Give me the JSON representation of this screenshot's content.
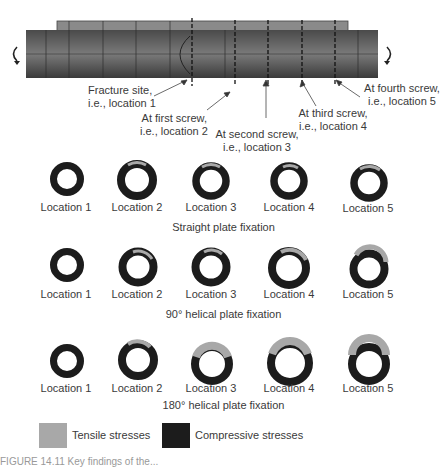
{
  "figure": {
    "bone_model": {
      "rotation_left": "counter-rotation arrow",
      "rotation_right": "rotation arrow",
      "callouts": [
        {
          "id": "loc1",
          "line1": "Fracture site,",
          "line2": "i.e., location 1"
        },
        {
          "id": "loc2",
          "line1": "At first screw,",
          "line2": "i.e., location 2"
        },
        {
          "id": "loc3",
          "line1": "At second screw,",
          "line2": "i.e., location 3"
        },
        {
          "id": "loc4",
          "line1": "At third screw,",
          "line2": "i.e., location 4"
        },
        {
          "id": "loc5",
          "line1": "At fourth screw,",
          "line2": "i.e., location 5"
        }
      ]
    },
    "rows": [
      {
        "caption": "Straight plate fixation",
        "locations": [
          "Location 1",
          "Location 2",
          "Location 3",
          "Location 4",
          "Location 5"
        ],
        "tensile_fraction": [
          0.0,
          0.04,
          0.08,
          0.06,
          0.06
        ]
      },
      {
        "caption": "90° helical plate fixation",
        "locations": [
          "Location 1",
          "Location 2",
          "Location 3",
          "Location 4",
          "Location 5"
        ],
        "tensile_fraction": [
          0.0,
          0.08,
          0.06,
          0.12,
          0.18
        ]
      },
      {
        "caption": "180° helical plate fixation",
        "locations": [
          "Location 1",
          "Location 2",
          "Location 3",
          "Location 4",
          "Location 5"
        ],
        "tensile_fraction": [
          0.0,
          0.1,
          0.3,
          0.38,
          0.35
        ]
      }
    ],
    "legend": {
      "tensile": {
        "label": "Tensile stresses",
        "color": "#a8a8a8"
      },
      "compressive": {
        "label": "Compressive stresses",
        "color": "#1c1c1c"
      }
    },
    "caption": "FIGURE 14.11 Key findings of the..."
  }
}
